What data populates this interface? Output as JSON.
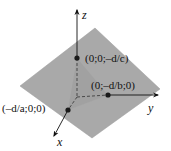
{
  "diagram": {
    "type": "3d-plane-intercepts",
    "axes": {
      "x": {
        "label": "x"
      },
      "y": {
        "label": "y"
      },
      "z": {
        "label": "z"
      }
    },
    "points": [
      {
        "id": "z-intercept",
        "label": "(0;0;–d/c)"
      },
      {
        "id": "y-intercept",
        "label": "(0;–d/b;0)"
      },
      {
        "id": "x-intercept",
        "label": "(–d/a;0;0)"
      }
    ],
    "colors": {
      "plane": "#a9a9a9",
      "plane_edge": "#9a9a9a",
      "inner_triangle": "#9c9c9c",
      "axis": "#111111",
      "point": "#1a1a1a"
    }
  }
}
